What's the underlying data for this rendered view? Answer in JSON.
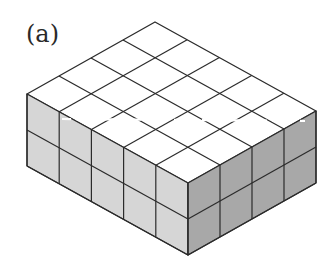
{
  "figure": {
    "label": "(a)",
    "cubes_along_front_left_edge": 5,
    "cubes_along_front_right_edge": 4,
    "layers": 2,
    "total_cubes": 40
  },
  "geometry": {
    "left_vertex": [
      27,
      94
    ],
    "front_vertex": [
      188,
      183
    ],
    "right_vertex": [
      316,
      111
    ],
    "top_vertex": [
      156,
      21
    ],
    "height": 72
  },
  "colors": {
    "top_face": "#ffffff",
    "left_face": "#d6d6d6",
    "right_face": "#a8a8a8",
    "edge": "#2b2b2b",
    "dash": "#ffffff"
  }
}
